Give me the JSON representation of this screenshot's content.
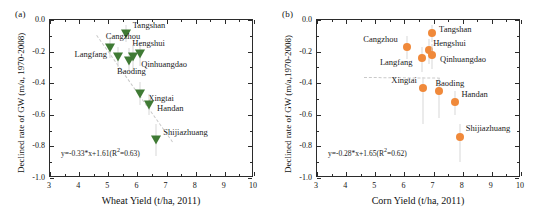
{
  "figure": {
    "panels": [
      {
        "tag": "(a)",
        "xlabel": "Wheat Yield (t/ha, 2011)",
        "ylabel": "Declined rate of GW (m/a, 1970-2008)",
        "equation_prefix": "y=-0.33*x+1.61(R",
        "equation_sup": "2",
        "equation_suffix": "=0.63)",
        "marker_color": "#3f7a34",
        "marker_shape": "triangle-down"
      },
      {
        "tag": "(b)",
        "xlabel": "Corn Yield (t/ha, 2011)",
        "ylabel": "Declined rate of GW (m/a,1970-2008)",
        "equation_prefix": "y=-0.28*x+1.65(R",
        "equation_sup": "2",
        "equation_suffix": "=0.62)",
        "marker_color": "#f0893a",
        "marker_shape": "circle"
      }
    ]
  },
  "chart_data": [
    {
      "type": "scatter",
      "panel": "(a)",
      "title": "",
      "xlabel": "Wheat Yield (t/ha, 2011)",
      "ylabel": "Declined rate of GW (m/a, 1970-2008)",
      "xlim": [
        3,
        10
      ],
      "ylim": [
        -1.0,
        0.0
      ],
      "xticks": [
        3,
        4,
        5,
        6,
        7,
        8,
        9,
        10
      ],
      "yticks": [
        0.0,
        -0.2,
        -0.4,
        -0.6,
        -0.8,
        -1.0
      ],
      "xticklabels": [
        "3",
        "4",
        "5",
        "6",
        "7",
        "8",
        "9",
        "10"
      ],
      "yticklabels": [
        "0.0",
        "-0.2",
        "-0.4",
        "-0.6",
        "-0.8",
        "-1.0"
      ],
      "grid": false,
      "legend": false,
      "marker_color": "#3f7a34",
      "marker_shape": "triangle-down",
      "annotation": "y=-0.33*x+1.61(R2=0.63)",
      "fit": {
        "slope": -0.33,
        "intercept": 1.61,
        "r2": 0.63
      },
      "points": [
        {
          "label": "Tangshan",
          "x": 5.6,
          "y": -0.08,
          "err_low": -0.14,
          "err_high": -0.03,
          "label_dx": 7,
          "label_dy": -9
        },
        {
          "label": "Cangzhou",
          "x": 5.05,
          "y": -0.17,
          "err_low": -0.24,
          "err_high": -0.11,
          "label_dx": -4,
          "label_dy": -12
        },
        {
          "label": "Langfang",
          "x": 5.35,
          "y": -0.23,
          "err_low": -0.3,
          "err_high": -0.17,
          "label_dx": -44,
          "label_dy": -3
        },
        {
          "label": "Hengshui",
          "x": 6.1,
          "y": -0.21,
          "err_low": -0.29,
          "err_high": -0.14,
          "label_dx": -8,
          "label_dy": -11
        },
        {
          "label": "Qinhuangdao",
          "x": 5.72,
          "y": -0.25,
          "err_low": -0.33,
          "err_high": -0.18,
          "label_dx": 12,
          "label_dy": 3
        },
        {
          "label": "Baoding",
          "x": 5.85,
          "y": -0.23,
          "err_low": -0.32,
          "err_high": -0.16,
          "label_dx": -16,
          "label_dy": 14
        },
        {
          "label": "Xingtai",
          "x": 6.1,
          "y": -0.46,
          "err_low": -0.54,
          "err_high": -0.39,
          "label_dx": 8,
          "label_dy": 4
        },
        {
          "label": "Handan",
          "x": 6.4,
          "y": -0.53,
          "err_low": -0.6,
          "err_high": -0.47,
          "label_dx": 8,
          "label_dy": 3
        },
        {
          "label": "Shijiazhuang",
          "x": 6.65,
          "y": -0.75,
          "err_low": -0.86,
          "err_high": -0.66,
          "label_dx": 7,
          "label_dy": -8
        }
      ]
    },
    {
      "type": "scatter",
      "panel": "(b)",
      "title": "",
      "xlabel": "Corn Yield (t/ha, 2011)",
      "ylabel": "Declined rate of GW (m/a,1970-2008)",
      "xlim": [
        3,
        10
      ],
      "ylim": [
        -1.0,
        0.0
      ],
      "xticks": [
        3,
        4,
        5,
        6,
        7,
        8,
        9,
        10
      ],
      "yticks": [
        0.0,
        -0.2,
        -0.4,
        -0.6,
        -0.8,
        -1.0
      ],
      "xticklabels": [
        "3",
        "4",
        "5",
        "6",
        "7",
        "8",
        "9",
        "10"
      ],
      "yticklabels": [
        "0.0",
        "-0.2",
        "-0.4",
        "-0.6",
        "-0.8",
        "-1.0"
      ],
      "grid": false,
      "legend": false,
      "marker_color": "#f0893a",
      "marker_shape": "circle",
      "annotation": "y=-0.28*x+1.65(R2=0.62)",
      "fit": {
        "slope": -0.28,
        "intercept": 1.65,
        "r2": 0.62
      },
      "points": [
        {
          "label": "Tangshan",
          "x": 6.95,
          "y": -0.08,
          "err_low": -0.14,
          "err_high": -0.03,
          "label_dx": 7,
          "label_dy": -5
        },
        {
          "label": "Cangzhou",
          "x": 6.1,
          "y": -0.17,
          "err_low": -0.25,
          "err_high": -0.1,
          "label_dx": -44,
          "label_dy": -9
        },
        {
          "label": "Hengshui",
          "x": 6.85,
          "y": -0.19,
          "err_low": -0.28,
          "err_high": -0.12,
          "label_dx": 4,
          "label_dy": -8
        },
        {
          "label": "Qinhuangdao",
          "x": 6.95,
          "y": -0.22,
          "err_low": -0.31,
          "err_high": -0.15,
          "label_dx": 8,
          "label_dy": 3
        },
        {
          "label": "Langfang",
          "x": 6.6,
          "y": -0.24,
          "err_low": -0.33,
          "err_high": -0.17,
          "label_dx": -42,
          "label_dy": 3
        },
        {
          "label": "Xingtai",
          "x": 6.65,
          "y": -0.43,
          "err_low": -0.66,
          "err_high": -0.36,
          "label_dx": -32,
          "label_dy": -9
        },
        {
          "label": "Baoding",
          "x": 7.2,
          "y": -0.45,
          "err_low": -0.62,
          "err_high": -0.37,
          "label_dx": -4,
          "label_dy": -9
        },
        {
          "label": "Handan",
          "x": 7.75,
          "y": -0.52,
          "err_low": -0.6,
          "err_high": -0.45,
          "label_dx": 6,
          "label_dy": -9
        },
        {
          "label": "Shijiazhuang",
          "x": 7.9,
          "y": -0.74,
          "err_low": -0.9,
          "err_high": -0.66,
          "label_dx": 6,
          "label_dy": -10
        }
      ]
    }
  ]
}
